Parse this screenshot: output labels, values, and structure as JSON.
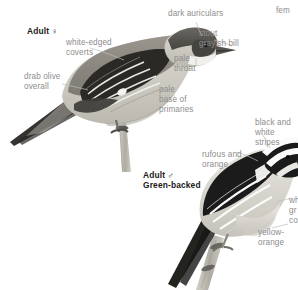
{
  "plate": {
    "background_color": "#ffffff",
    "label_color": "#8d8d8d",
    "heading_color": "#1a1a1a"
  },
  "partial_text": {
    "top_right": "fem",
    "right_mid_1": "wh",
    "right_mid_2": "gr",
    "right_mid_3": "co"
  },
  "figures": [
    {
      "id": "adult-female",
      "heading": "Adult ♀",
      "labels": [
        {
          "id": "white-edged-coverts",
          "text": "white-edged\ncoverts"
        },
        {
          "id": "drab-olive-overall",
          "text": "drab olive\noverall"
        },
        {
          "id": "dark-auriculars",
          "text": "dark auriculars"
        },
        {
          "id": "stout-grayish-bill",
          "text": "stout\ngrayish bill"
        },
        {
          "id": "pale-throat",
          "text": "pale\nthroat"
        },
        {
          "id": "pale-base-of-primaries",
          "text": "pale\nbase of\nprimaries"
        }
      ]
    },
    {
      "id": "adult-male-green-backed",
      "heading": "Adult ♂\nGreen-backed",
      "labels": [
        {
          "id": "black-and-white-stripes",
          "text": "black and\nwhite stripes"
        },
        {
          "id": "rufous-and-orange",
          "text": "rufous and\norange"
        },
        {
          "id": "yellow-orange",
          "text": "yellow-\norange"
        }
      ]
    }
  ],
  "colors": {
    "bird1_cap": "#5c5955",
    "bird1_back": "#8e8b84",
    "bird1_wing_dark": "#2a2926",
    "bird1_belly": "#cfccc4",
    "bird1_throat": "#efeeea",
    "bird1_tail": "#353431",
    "bird2_black": "#1b1b1b",
    "bird2_white": "#fbfbfb",
    "bird2_belly": "#d8d5cd",
    "branch": "#b9b6ae"
  }
}
